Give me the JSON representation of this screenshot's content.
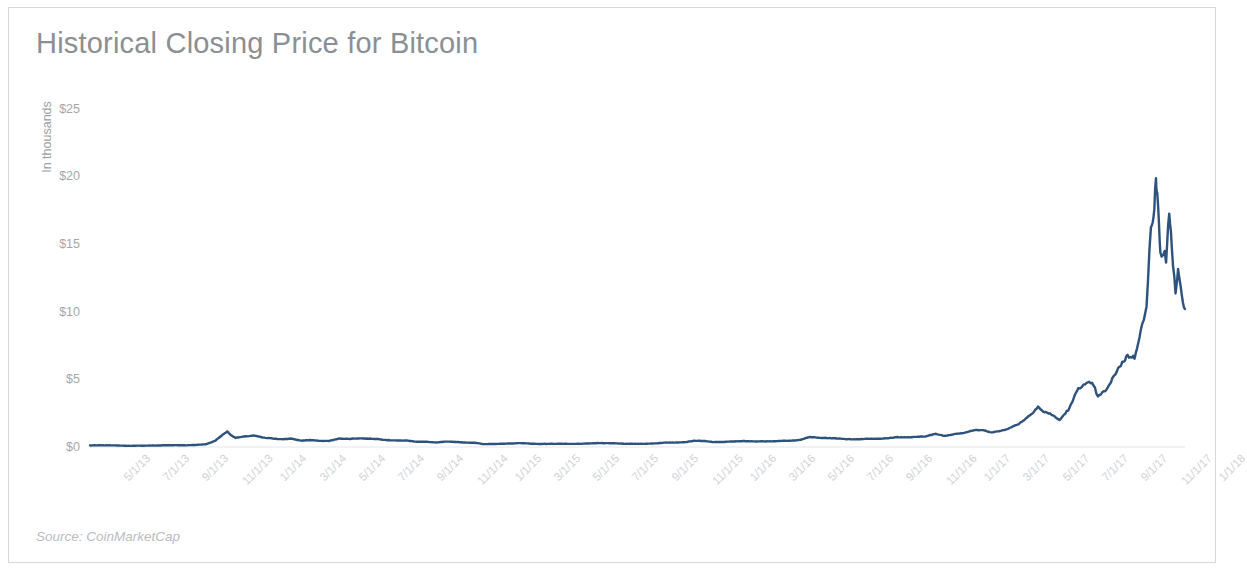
{
  "figure": {
    "title": "Historical Closing Price for Bitcoin",
    "source_note": "Source: CoinMarketCap",
    "background_color": "#ffffff",
    "frame_color": "#d8d8d8"
  },
  "chart_data": {
    "type": "line",
    "title": "Historical Closing Price for Bitcoin",
    "subtitle": "",
    "xlabel": "",
    "ylabel": "In thousands",
    "units": "thousands of US dollars",
    "grid": false,
    "legend": null,
    "line_color": "#2d527c",
    "line_width": 2.4,
    "axis_color": "#a3a7ab",
    "ylim": [
      0,
      26
    ],
    "ytick_values": [
      0,
      5,
      10,
      15,
      20,
      25
    ],
    "ytick_labels": [
      "$0",
      "$5",
      "$10",
      "$15",
      "$20",
      "$25"
    ],
    "xtick_labels": [
      "5/1/13",
      "7/1/13",
      "9/1/13",
      "11/1/13",
      "1/1/14",
      "3/1/14",
      "5/1/14",
      "7/1/14",
      "9/1/14",
      "11/1/14",
      "1/1/15",
      "3/1/15",
      "5/1/15",
      "7/1/15",
      "9/1/15",
      "11/1/15",
      "1/1/16",
      "3/1/16",
      "5/1/16",
      "7/1/16",
      "9/1/16",
      "11/1/16",
      "1/1/17",
      "3/1/17",
      "5/1/17",
      "7/1/17",
      "9/1/17",
      "11/1/17",
      "1/1/18"
    ],
    "xlim_labels": [
      "5/1/13",
      "1/1/18"
    ],
    "x_axis_type": "date_monthly",
    "series": [
      {
        "name": "Bitcoin closing price",
        "x": [
          "2013-05-01",
          "2013-05-15",
          "2013-06-01",
          "2013-06-15",
          "2013-07-01",
          "2013-07-15",
          "2013-08-01",
          "2013-08-15",
          "2013-09-01",
          "2013-09-15",
          "2013-10-01",
          "2013-10-15",
          "2013-11-01",
          "2013-11-15",
          "2013-11-25",
          "2013-12-01",
          "2013-12-05",
          "2013-12-10",
          "2013-12-18",
          "2013-12-25",
          "2014-01-01",
          "2014-01-15",
          "2014-02-01",
          "2014-02-15",
          "2014-03-01",
          "2014-03-15",
          "2014-04-01",
          "2014-04-15",
          "2014-05-01",
          "2014-05-15",
          "2014-06-01",
          "2014-06-15",
          "2014-07-01",
          "2014-07-15",
          "2014-08-01",
          "2014-08-15",
          "2014-09-01",
          "2014-09-15",
          "2014-10-01",
          "2014-10-15",
          "2014-11-01",
          "2014-11-15",
          "2014-12-01",
          "2014-12-15",
          "2015-01-01",
          "2015-01-15",
          "2015-02-01",
          "2015-02-15",
          "2015-03-01",
          "2015-03-15",
          "2015-04-01",
          "2015-04-15",
          "2015-05-01",
          "2015-05-15",
          "2015-06-01",
          "2015-06-15",
          "2015-07-01",
          "2015-07-15",
          "2015-08-01",
          "2015-08-15",
          "2015-09-01",
          "2015-09-15",
          "2015-10-01",
          "2015-10-15",
          "2015-11-01",
          "2015-11-15",
          "2015-12-01",
          "2015-12-15",
          "2016-01-01",
          "2016-01-15",
          "2016-02-01",
          "2016-02-15",
          "2016-03-01",
          "2016-03-15",
          "2016-04-01",
          "2016-04-15",
          "2016-05-01",
          "2016-05-15",
          "2016-06-01",
          "2016-06-15",
          "2016-07-01",
          "2016-07-15",
          "2016-08-01",
          "2016-08-15",
          "2016-09-01",
          "2016-09-15",
          "2016-10-01",
          "2016-10-15",
          "2016-11-01",
          "2016-11-15",
          "2016-12-01",
          "2016-12-15",
          "2017-01-01",
          "2017-01-15",
          "2017-02-01",
          "2017-02-15",
          "2017-03-01",
          "2017-03-15",
          "2017-04-01",
          "2017-04-15",
          "2017-05-01",
          "2017-05-15",
          "2017-06-01",
          "2017-06-12",
          "2017-06-20",
          "2017-07-01",
          "2017-07-16",
          "2017-08-01",
          "2017-08-15",
          "2017-09-01",
          "2017-09-08",
          "2017-09-15",
          "2017-10-01",
          "2017-10-15",
          "2017-11-01",
          "2017-11-12",
          "2017-11-20",
          "2017-12-01",
          "2017-12-08",
          "2017-12-12",
          "2017-12-16",
          "2017-12-18",
          "2017-12-22",
          "2017-12-25",
          "2017-12-29",
          "2018-01-01",
          "2018-01-06",
          "2018-01-10",
          "2018-01-16",
          "2018-01-20",
          "2018-01-26",
          "2018-01-31"
        ],
        "y": [
          0.117,
          0.122,
          0.129,
          0.108,
          0.085,
          0.095,
          0.103,
          0.11,
          0.132,
          0.135,
          0.127,
          0.15,
          0.205,
          0.45,
          0.82,
          1.03,
          1.15,
          0.88,
          0.68,
          0.73,
          0.77,
          0.85,
          0.68,
          0.63,
          0.57,
          0.62,
          0.47,
          0.51,
          0.45,
          0.45,
          0.63,
          0.6,
          0.64,
          0.62,
          0.59,
          0.51,
          0.48,
          0.48,
          0.39,
          0.39,
          0.33,
          0.395,
          0.38,
          0.33,
          0.315,
          0.21,
          0.225,
          0.24,
          0.26,
          0.29,
          0.245,
          0.225,
          0.235,
          0.24,
          0.225,
          0.235,
          0.262,
          0.29,
          0.285,
          0.265,
          0.23,
          0.235,
          0.24,
          0.268,
          0.33,
          0.335,
          0.36,
          0.465,
          0.434,
          0.365,
          0.375,
          0.41,
          0.435,
          0.415,
          0.418,
          0.425,
          0.45,
          0.455,
          0.537,
          0.74,
          0.675,
          0.66,
          0.625,
          0.575,
          0.575,
          0.61,
          0.61,
          0.635,
          0.735,
          0.705,
          0.745,
          0.79,
          0.965,
          0.82,
          0.975,
          1.05,
          1.23,
          1.25,
          1.08,
          1.205,
          1.45,
          1.79,
          2.42,
          2.98,
          2.6,
          2.48,
          1.98,
          2.87,
          4.38,
          4.73,
          4.6,
          3.68,
          4.37,
          5.67,
          6.75,
          6.6,
          8.25,
          10.2,
          16.5,
          17.1,
          19.5,
          18.9,
          15.0,
          13.9,
          14.6,
          13.4,
          17.5,
          14.9,
          11.2,
          13.0,
          11.1,
          10.2
        ]
      }
    ],
    "annotations": [],
    "peak": {
      "label": "all-time high",
      "value": 19.5,
      "date": "2017-12-16"
    },
    "final_value": 10.2
  }
}
